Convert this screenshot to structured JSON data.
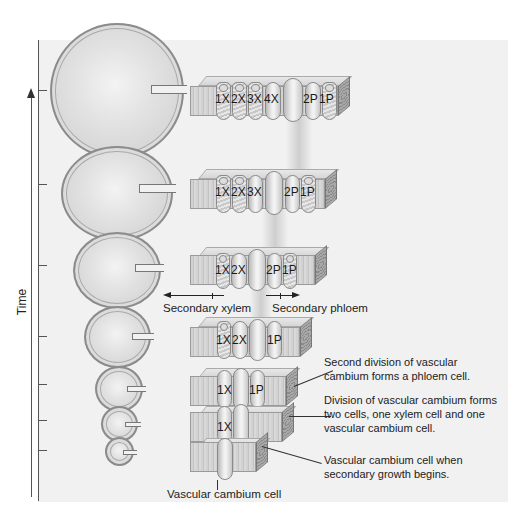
{
  "axis": {
    "label": "Time",
    "direction": "up"
  },
  "stages": [
    {
      "name": "stage-1",
      "cells": [
        "1X",
        "",
        "",
        "",
        "",
        ""
      ],
      "xylem_count": 0,
      "label_texts": []
    },
    {
      "name": "stage-2",
      "cells": [
        "1X",
        "1P"
      ]
    },
    {
      "name": "stage-3",
      "cells": [
        "1X",
        "1P"
      ]
    },
    {
      "name": "stage-4",
      "cells": [
        "1X",
        "2X",
        "1P"
      ]
    },
    {
      "name": "stage-5",
      "cells": [
        "1X",
        "2X",
        "2P",
        "1P"
      ]
    },
    {
      "name": "stage-6",
      "cells": [
        "1X",
        "2X",
        "3X",
        "2P",
        "1P"
      ]
    },
    {
      "name": "stage-7",
      "cells": [
        "1X",
        "2X",
        "3X",
        "4X",
        "2P",
        "1P"
      ]
    }
  ],
  "cell_labels": {
    "s7": [
      "1X",
      "2X",
      "3X",
      "4X",
      "2P",
      "1P"
    ],
    "s6": [
      "1X",
      "2X",
      "3X",
      "2P",
      "1P"
    ],
    "s5": [
      "1X",
      "2X",
      "2P",
      "1P"
    ],
    "s4": [
      "1X",
      "2X",
      "1P"
    ],
    "s3": [
      "1X",
      "1P"
    ],
    "s2": [
      "1X"
    ]
  },
  "direction_labels": {
    "xylem": "Secondary xylem",
    "phloem": "Secondary phloem"
  },
  "annotations": {
    "second_division": "Second division of vascular cambium forms a phloem cell.",
    "first_division": "Division of vascular cambium forms two cells, one xylem cell and one vascular cambium cell.",
    "initial": "Vascular cambium cell when secondary growth begins.",
    "cambium_cell": "Vascular cambium cell"
  },
  "annotation_lines": {
    "second_division": [
      "Second division of vascular",
      "cambium forms a phloem cell."
    ],
    "first_division": [
      "Division of vascular cambium forms",
      "two cells, one xylem cell and one",
      "vascular cambium cell."
    ],
    "initial": [
      "Vascular cambium cell when",
      "secondary growth begins."
    ]
  }
}
